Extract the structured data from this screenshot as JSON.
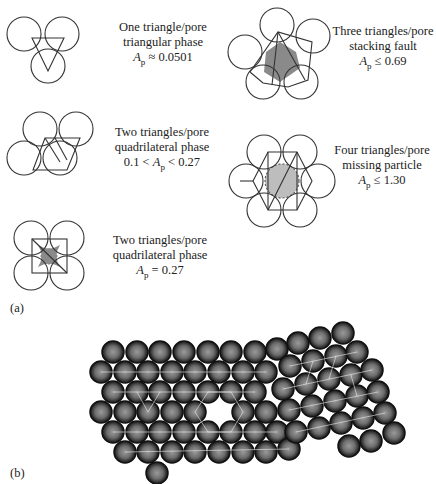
{
  "figure": {
    "panel_a": {
      "label": "(a)",
      "cells": [
        {
          "id": "triangular",
          "line1": "One triangle/pore",
          "line2": "triangular phase",
          "ap_prefix": "",
          "ap_symbol": "A",
          "ap_sub": "p",
          "ap_relation": " ≈ 0.0501"
        },
        {
          "id": "stacking-fault",
          "line1": "Three triangles/pore",
          "line2": "stacking fault",
          "ap_prefix": "",
          "ap_symbol": "A",
          "ap_sub": "p",
          "ap_relation": " ≤ 0.69"
        },
        {
          "id": "quadrilateral-range",
          "line1": "Two triangles/pore",
          "line2": "quadrilateral phase",
          "ap_prefix": "0.1 < ",
          "ap_symbol": "A",
          "ap_sub": "p",
          "ap_relation": " < 0.27"
        },
        {
          "id": "missing-particle",
          "line1": "Four triangles/pore",
          "line2": "missing particle",
          "ap_prefix": "",
          "ap_symbol": "A",
          "ap_sub": "p",
          "ap_relation": " ≤ 1.30"
        },
        {
          "id": "quadrilateral-square",
          "line1": "Two triangles/pore",
          "line2": "quadrilateral phase",
          "ap_prefix": "",
          "ap_symbol": "A",
          "ap_sub": "p",
          "ap_relation": " = 0.27"
        }
      ]
    },
    "panel_b": {
      "label": "(b)",
      "description": "Micrograph-style rendering of a close-packed particle monolayer with triangulation overlay and a missing-particle vacancy"
    },
    "colors": {
      "line": "#333333",
      "pore_fill": "#8a8a8a",
      "missing_fill": "#bdbdbd",
      "particle_edge": "#1e1e1e",
      "particle_core": "#8c8c8c",
      "overlay": "#e8e8e8"
    }
  }
}
